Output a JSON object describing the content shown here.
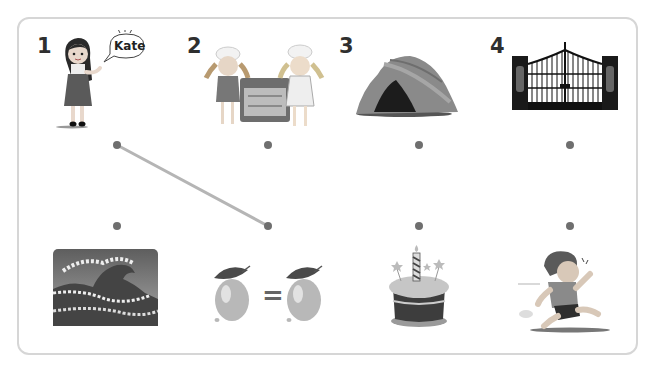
{
  "exercise": {
    "type": "match-pictures",
    "top_items": [
      {
        "number": "1",
        "picture": "girl-introducing-herself",
        "speech_bubble": "Kate"
      },
      {
        "number": "2",
        "picture": "children-baking-at-oven"
      },
      {
        "number": "3",
        "picture": "rock-cave"
      },
      {
        "number": "4",
        "picture": "iron-gate"
      }
    ],
    "bottom_items": [
      {
        "picture": "big-ocean-wave"
      },
      {
        "picture": "lemon-equals-lemon"
      },
      {
        "picture": "birthday-cake-with-candle"
      },
      {
        "picture": "boy-running-scared"
      }
    ],
    "connections": [
      {
        "from_top": 1,
        "to_bottom": 2
      }
    ],
    "colors": {
      "dot": "#6f6f6f",
      "line": "#b5b5b5",
      "border": "#d6d6d6",
      "number": "#2f2f2f"
    },
    "equals_sign": "="
  }
}
